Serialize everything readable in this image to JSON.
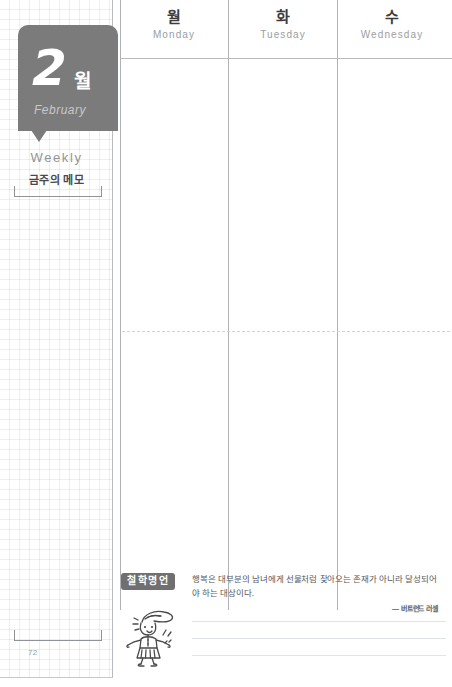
{
  "month_tab": {
    "number": "2",
    "unit_kr": "월",
    "name_en": "February"
  },
  "memo": {
    "title_en": "Weekly",
    "title_kr": "금주의 메모"
  },
  "page_number": "72",
  "columns": [
    {
      "kr": "월",
      "en": "Monday"
    },
    {
      "kr": "화",
      "en": "Tuesday"
    },
    {
      "kr": "수",
      "en": "Wednesday"
    }
  ],
  "quote": {
    "badge": "철학명언",
    "text": "행복은 대부분의 남녀에게 선물처럼 찾아오는 존재가 아니라 달성되어야 하는 대상이다.",
    "author": "— 버트런드 러셀"
  },
  "colors": {
    "tab_gray": "#7b7b7b",
    "badge_gray": "#6f6f6f",
    "rule_gray": "#b9bcbf",
    "text_dark": "#3c3c3c",
    "text_muted": "#9b9ea1"
  }
}
